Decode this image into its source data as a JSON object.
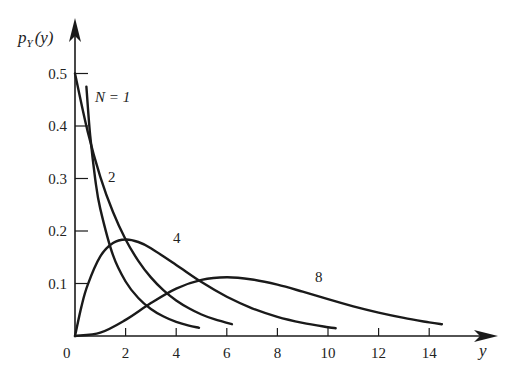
{
  "chart_data": {
    "type": "line",
    "title": "",
    "xlabel": "y",
    "ylabel": "p_Y(y)",
    "ylabel_parts": {
      "p": "p",
      "sub": "Y",
      "arg": "(y)"
    },
    "xlim": [
      0,
      16
    ],
    "ylim": [
      0,
      0.55
    ],
    "grid": false,
    "legend": "inline labels",
    "x_ticks": [
      0,
      2,
      4,
      6,
      8,
      10,
      12,
      14
    ],
    "x_tick_labels": [
      "0",
      "2",
      "4",
      "6",
      "8",
      "10",
      "12",
      "14"
    ],
    "y_ticks": [
      0.1,
      0.2,
      0.3,
      0.4,
      0.5
    ],
    "y_tick_labels": [
      "0.1",
      "0.2",
      "0.3",
      "0.4",
      "0.5"
    ],
    "series": [
      {
        "name": "N = 1",
        "label": "N = 1",
        "x": [
          0.45,
          0.6,
          0.8,
          1.0,
          1.5,
          2.0,
          2.5,
          3.0,
          3.5,
          4.0,
          4.5,
          4.9
        ],
        "values": [
          0.475,
          0.3815,
          0.299,
          0.242,
          0.1539,
          0.1038,
          0.0723,
          0.0514,
          0.0371,
          0.027,
          0.0198,
          0.0156
        ]
      },
      {
        "name": "N = 2",
        "label": "2",
        "x": [
          0,
          0.5,
          1.0,
          1.5,
          2.0,
          2.5,
          3.0,
          3.5,
          4.0,
          4.5,
          5.0,
          5.5,
          6.2
        ],
        "values": [
          0.5,
          0.3894,
          0.3033,
          0.2362,
          0.1839,
          0.1433,
          0.1116,
          0.0869,
          0.0677,
          0.0527,
          0.041,
          0.032,
          0.0225
        ]
      },
      {
        "name": "N = 4",
        "label": "4",
        "x": [
          0,
          0.25,
          0.5,
          1.0,
          1.5,
          2.0,
          2.5,
          3.0,
          4.0,
          5.0,
          6.0,
          7.0,
          8.0,
          9.0,
          10.0,
          10.3
        ],
        "values": [
          0,
          0.0551,
          0.0974,
          0.1516,
          0.1771,
          0.1839,
          0.1791,
          0.1673,
          0.1353,
          0.1026,
          0.0747,
          0.0528,
          0.0366,
          0.025,
          0.0168,
          0.0149
        ]
      },
      {
        "name": "N = 8",
        "label": "8",
        "x": [
          0,
          1,
          2,
          3,
          4,
          5,
          6,
          7,
          8,
          9,
          10,
          11,
          12,
          13,
          14,
          14.5
        ],
        "values": [
          0,
          0.0063,
          0.0307,
          0.0627,
          0.0902,
          0.1069,
          0.112,
          0.1076,
          0.0977,
          0.0844,
          0.0702,
          0.0566,
          0.0446,
          0.0344,
          0.026,
          0.0225
        ]
      }
    ],
    "annotations": [
      {
        "text": "N = 1",
        "x_px": 95,
        "y_px": 102
      },
      {
        "text": "2",
        "x_px": 108,
        "y_px": 182
      },
      {
        "text": "4",
        "x_px": 173,
        "y_px": 243
      },
      {
        "text": "8",
        "x_px": 315,
        "y_px": 282
      }
    ]
  },
  "axes": {
    "origin_label": "0",
    "x_axis_label": "y"
  },
  "style": {
    "line_color": "#1a1a1a",
    "text_color": "#222222",
    "background": "#ffffff"
  }
}
